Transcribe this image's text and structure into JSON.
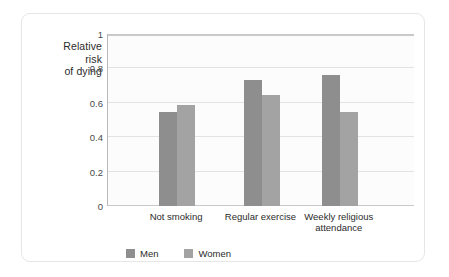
{
  "chart_data": {
    "type": "bar",
    "title": "",
    "subtitle": "",
    "xlabel": "",
    "ylabel": "Relative risk of dying",
    "ylabel_lines": [
      "Relative",
      "risk",
      "of dying"
    ],
    "categories": [
      "Not smoking",
      "Regular exercise",
      "Weekly religious attendance"
    ],
    "category_lines": [
      [
        "Not smoking"
      ],
      [
        "Regular exercise"
      ],
      [
        "Weekly religious",
        "attendance"
      ]
    ],
    "series": [
      {
        "name": "Men",
        "values": [
          0.545,
          0.73,
          0.76
        ],
        "color": "#8e8e8e"
      },
      {
        "name": "Women",
        "values": [
          0.585,
          0.645,
          0.545
        ],
        "color": "#a3a3a3"
      }
    ],
    "ylim": [
      0,
      1
    ],
    "yticks": [
      0,
      0.2,
      0.4,
      0.6,
      0.8,
      1
    ],
    "ytick_labels": [
      "0",
      "0.2",
      "0.4",
      "0.6",
      "0.8",
      "1"
    ],
    "grid": true,
    "grid_axis": "y",
    "legend_position": "bottom",
    "plot_background": "#fcfcfc",
    "gridline_color": "#e3e3e3",
    "axis_color": "#b9b9b9"
  }
}
